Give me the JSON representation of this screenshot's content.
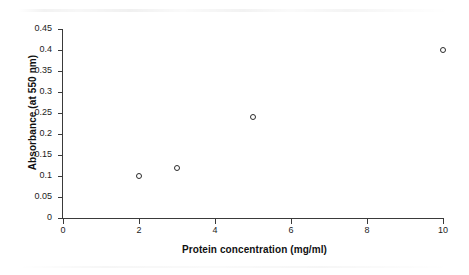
{
  "chart_data": {
    "type": "scatter",
    "title": "",
    "xlabel": "Protein concentration (mg/ml)",
    "ylabel": "Absorbance (at 550 nm)",
    "xlim": [
      0,
      10
    ],
    "ylim": [
      0,
      0.45
    ],
    "grid": false,
    "legend": null,
    "marker_style": "open-circle",
    "marker_color": "#2b2b2b",
    "x": [
      2,
      3,
      5,
      10
    ],
    "y": [
      0.1,
      0.12,
      0.24,
      0.4
    ],
    "points": [
      {
        "x": 2,
        "y": 0.1
      },
      {
        "x": 3,
        "y": 0.12
      },
      {
        "x": 5,
        "y": 0.24
      },
      {
        "x": 10,
        "y": 0.4
      }
    ],
    "series": [
      {
        "name": "Absorbance",
        "x": [
          2,
          3,
          5,
          10
        ],
        "values": [
          0.1,
          0.12,
          0.24,
          0.4
        ]
      }
    ],
    "x_ticks": [
      0,
      2,
      4,
      6,
      8,
      10
    ],
    "x_tick_labels": [
      "0",
      "2",
      "4",
      "6",
      "8",
      "10"
    ],
    "y_ticks": [
      0,
      0.05,
      0.1,
      0.15,
      0.2,
      0.25,
      0.3,
      0.35,
      0.4,
      0.45
    ],
    "y_tick_labels": [
      "0",
      "0.05",
      "0.1",
      "0.15",
      "0.2",
      "0.25",
      "0.3",
      "0.35",
      "0.4",
      "0.45"
    ]
  },
  "figure": {
    "background_color": "#ffffff",
    "axis_color": "#3a3a3a",
    "text_color": "#111111"
  }
}
